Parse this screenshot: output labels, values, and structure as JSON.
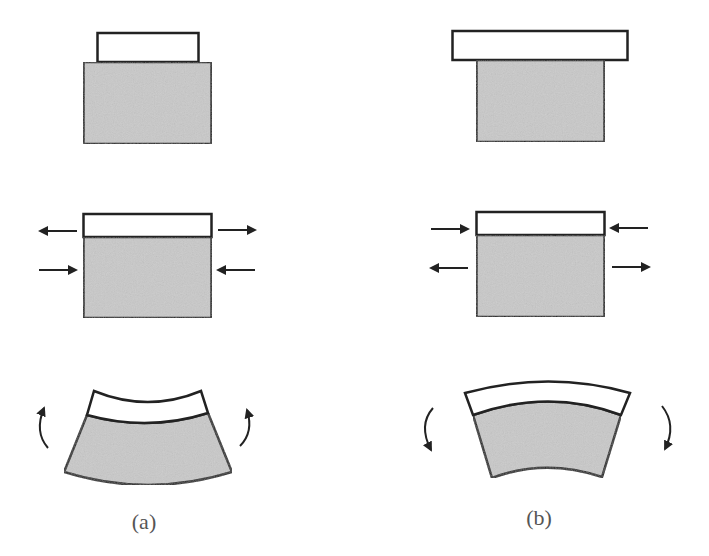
{
  "figure": {
    "colors": {
      "substrate_fill": "#c9c9c9",
      "film_fill": "#ffffff",
      "stroke": "#222222",
      "caption": "#555555"
    },
    "panels": [
      {
        "id": "a",
        "caption": "(a)",
        "case": "film narrower than substrate (tensile film)",
        "rows": [
          {
            "name": "unbonded-layers",
            "film": "narrower than substrate"
          },
          {
            "name": "bonded-forces",
            "film_arrows": "outward",
            "substrate_arrows": "inward"
          },
          {
            "name": "bent-bilayer",
            "curvature": "concave up (film on concave side)",
            "moment_arrows": "upward"
          }
        ]
      },
      {
        "id": "b",
        "caption": "(b)",
        "case": "film wider than substrate (compressive film)",
        "rows": [
          {
            "name": "unbonded-layers",
            "film": "wider than substrate"
          },
          {
            "name": "bonded-forces",
            "film_arrows": "inward",
            "substrate_arrows": "outward"
          },
          {
            "name": "bent-bilayer",
            "curvature": "convex up (film on convex side)",
            "moment_arrows": "downward"
          }
        ]
      }
    ]
  }
}
